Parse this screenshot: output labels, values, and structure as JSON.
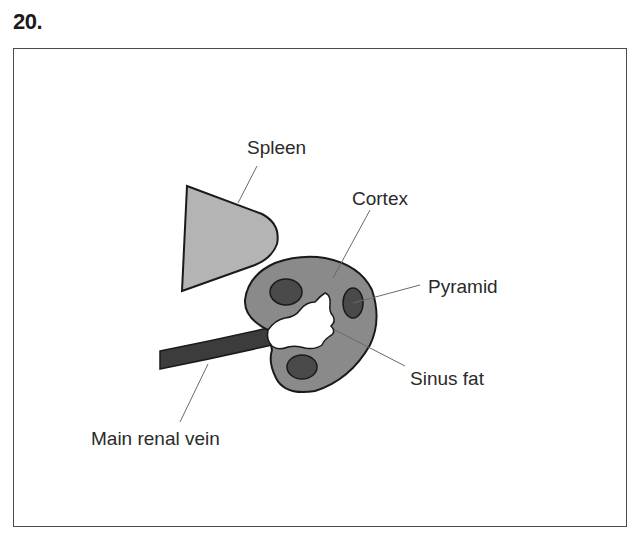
{
  "question": {
    "number": "20."
  },
  "diagram": {
    "labels": {
      "spleen": "Spleen",
      "cortex": "Cortex",
      "pyramid": "Pyramid",
      "sinus_fat": "Sinus fat",
      "main_renal_vein": "Main renal vein"
    },
    "colors": {
      "spleen_fill": "#b4b4b4",
      "cortex_fill": "#8a8a8a",
      "pyramid_fill": "#4a4a4a",
      "vein_fill": "#3c3c3c",
      "sinus_fat_fill": "#ffffff",
      "outline": "#1a1a1a",
      "leader_line": "#6a6a6a",
      "frame": "#4a4a4a"
    }
  }
}
